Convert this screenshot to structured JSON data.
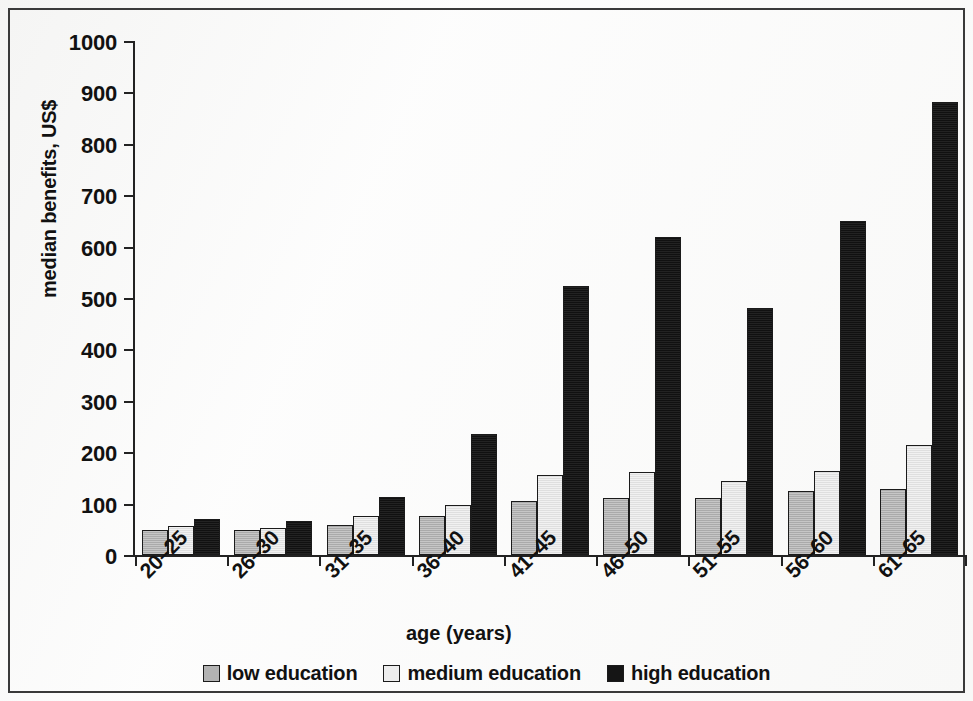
{
  "figure": {
    "background_color": "#fdfdfd",
    "frame_color": "#3a3a3a",
    "axis_color": "#222222"
  },
  "axes": {
    "y_title": "median benefits, US$",
    "x_title": "age (years)",
    "y_ticks": [
      "1000",
      "900",
      "800",
      "700",
      "600",
      "500",
      "400",
      "300",
      "200",
      "100",
      "0"
    ]
  },
  "legend": {
    "items": [
      {
        "label": "low education",
        "color": "#b3b3b3",
        "swatch": "low"
      },
      {
        "label": "medium education",
        "color": "#ededed",
        "swatch": "medium"
      },
      {
        "label": "high education",
        "color": "#151515",
        "swatch": "high"
      }
    ]
  },
  "chart_data": {
    "type": "bar",
    "title": "",
    "subtitle": "",
    "xlabel": "age (years)",
    "ylabel": "median benefits, US$",
    "ylim": [
      0,
      1000
    ],
    "ytick_step": 100,
    "grid": false,
    "legend_position": "bottom",
    "categories": [
      "20–25",
      "26–30",
      "31–35",
      "36–40",
      "41–45",
      "46–50",
      "51–55",
      "56–60",
      "61–65"
    ],
    "series": [
      {
        "name": "low education",
        "color": "#b3b3b3",
        "values": [
          49,
          49,
          59,
          76,
          105,
          111,
          111,
          124,
          128
        ]
      },
      {
        "name": "medium education",
        "color": "#ededed",
        "values": [
          57,
          52,
          76,
          98,
          155,
          162,
          144,
          164,
          215
        ]
      },
      {
        "name": "high education",
        "color": "#151515",
        "values": [
          70,
          66,
          113,
          235,
          524,
          619,
          480,
          650,
          882
        ]
      }
    ]
  }
}
